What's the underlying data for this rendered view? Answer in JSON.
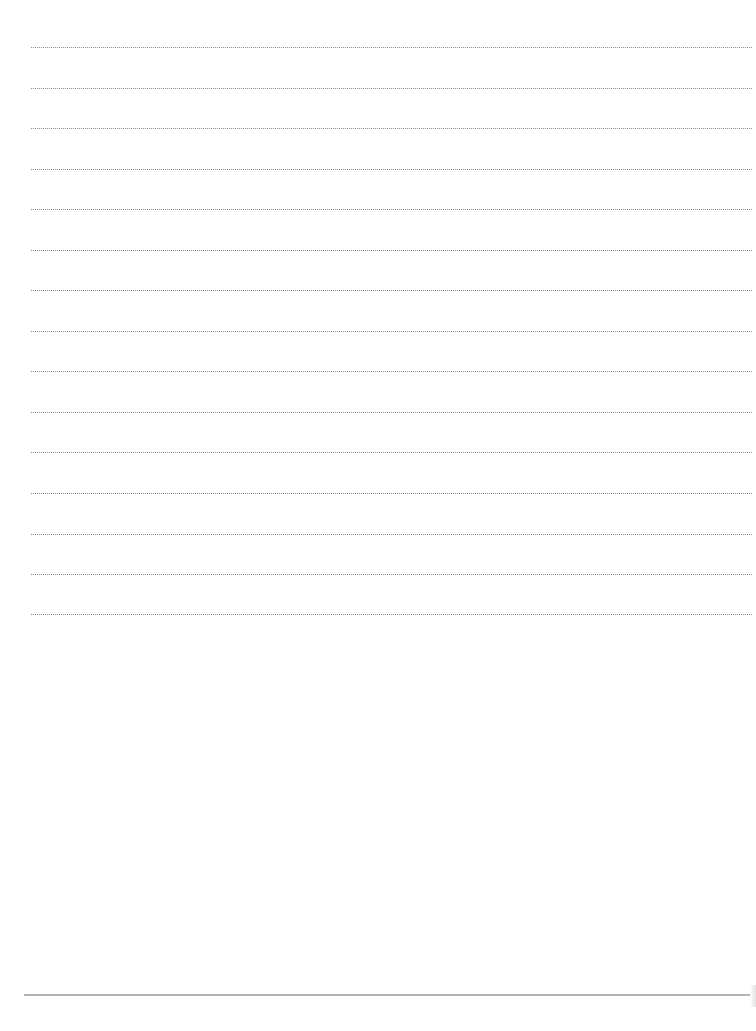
{
  "page": {
    "type": "lined-paper",
    "background_color": "#ffffff",
    "rule_color": "#8a8a8a",
    "bottom_rule_color": "#b4b4b4",
    "rule_count": 15,
    "rules_y": [
      47,
      88,
      128,
      169,
      209,
      250,
      290,
      331,
      371,
      412,
      452,
      493,
      534,
      574,
      614
    ]
  }
}
